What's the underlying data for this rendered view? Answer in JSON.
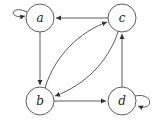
{
  "diagram": {
    "type": "directed-graph",
    "nodes": [
      {
        "id": "a",
        "label": "a",
        "x": 40,
        "y": 18
      },
      {
        "id": "c",
        "label": "c",
        "x": 122,
        "y": 18
      },
      {
        "id": "b",
        "label": "b",
        "x": 40,
        "y": 101
      },
      {
        "id": "d",
        "label": "d",
        "x": 122,
        "y": 101
      }
    ],
    "edges": [
      {
        "from": "a",
        "to": "a",
        "kind": "self-loop"
      },
      {
        "from": "c",
        "to": "a",
        "kind": "straight"
      },
      {
        "from": "a",
        "to": "b",
        "kind": "straight"
      },
      {
        "from": "b",
        "to": "c",
        "kind": "curved"
      },
      {
        "from": "c",
        "to": "b",
        "kind": "curved"
      },
      {
        "from": "b",
        "to": "d",
        "kind": "straight"
      },
      {
        "from": "d",
        "to": "c",
        "kind": "straight"
      },
      {
        "from": "d",
        "to": "d",
        "kind": "self-loop"
      }
    ],
    "colors": {
      "stroke": "#333333",
      "background": "#ffffff"
    }
  }
}
